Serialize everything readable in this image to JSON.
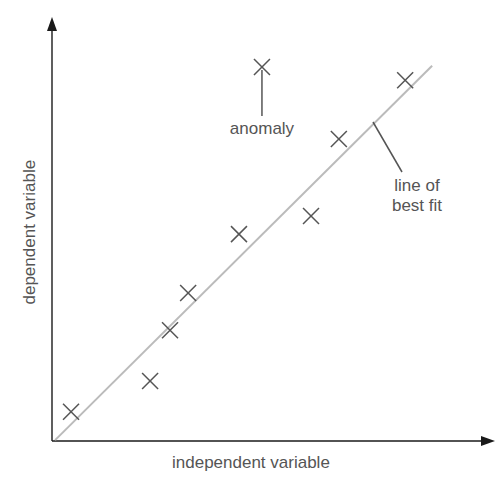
{
  "chart_data": {
    "type": "scatter",
    "title": "",
    "xlabel": "independent variable",
    "ylabel": "dependent variable",
    "xlim": [
      0,
      100
    ],
    "ylim": [
      0,
      100
    ],
    "grid": false,
    "ticks": false,
    "series": [
      {
        "name": "data points",
        "marker": "x",
        "points": [
          {
            "x": 4.3,
            "y": 6.9
          },
          {
            "x": 22.2,
            "y": 14.2
          },
          {
            "x": 26.7,
            "y": 26.2
          },
          {
            "x": 30.8,
            "y": 35.0
          },
          {
            "x": 42.3,
            "y": 48.9
          },
          {
            "x": 58.6,
            "y": 53.2
          },
          {
            "x": 64.9,
            "y": 71.4
          },
          {
            "x": 79.9,
            "y": 85.3
          }
        ]
      },
      {
        "name": "anomaly",
        "marker": "x",
        "points": [
          {
            "x": 47.5,
            "y": 88.4
          }
        ]
      }
    ],
    "best_fit_line": {
      "from": {
        "x": 0.7,
        "y": 0.2
      },
      "to": {
        "x": 86.0,
        "y": 88.7
      }
    },
    "annotations": [
      {
        "text": "anomaly",
        "target": "anomaly point",
        "style": "arrow line below point"
      },
      {
        "text": "line of\nbest fit",
        "target": "best fit line",
        "style": "pointer line"
      }
    ]
  },
  "labels": {
    "x_axis": "independent variable",
    "y_axis": "dependent variable",
    "anomaly": "anomaly",
    "fit_line_1": "line of",
    "fit_line_2": "best fit"
  },
  "colors": {
    "axis": "#1a1a1a",
    "marker": "#555555",
    "fit_line": "#bbbbbb",
    "text": "#555555"
  },
  "plot_box": {
    "origin_px": [
      52,
      441
    ],
    "width_px": 442,
    "height_px": 423
  }
}
